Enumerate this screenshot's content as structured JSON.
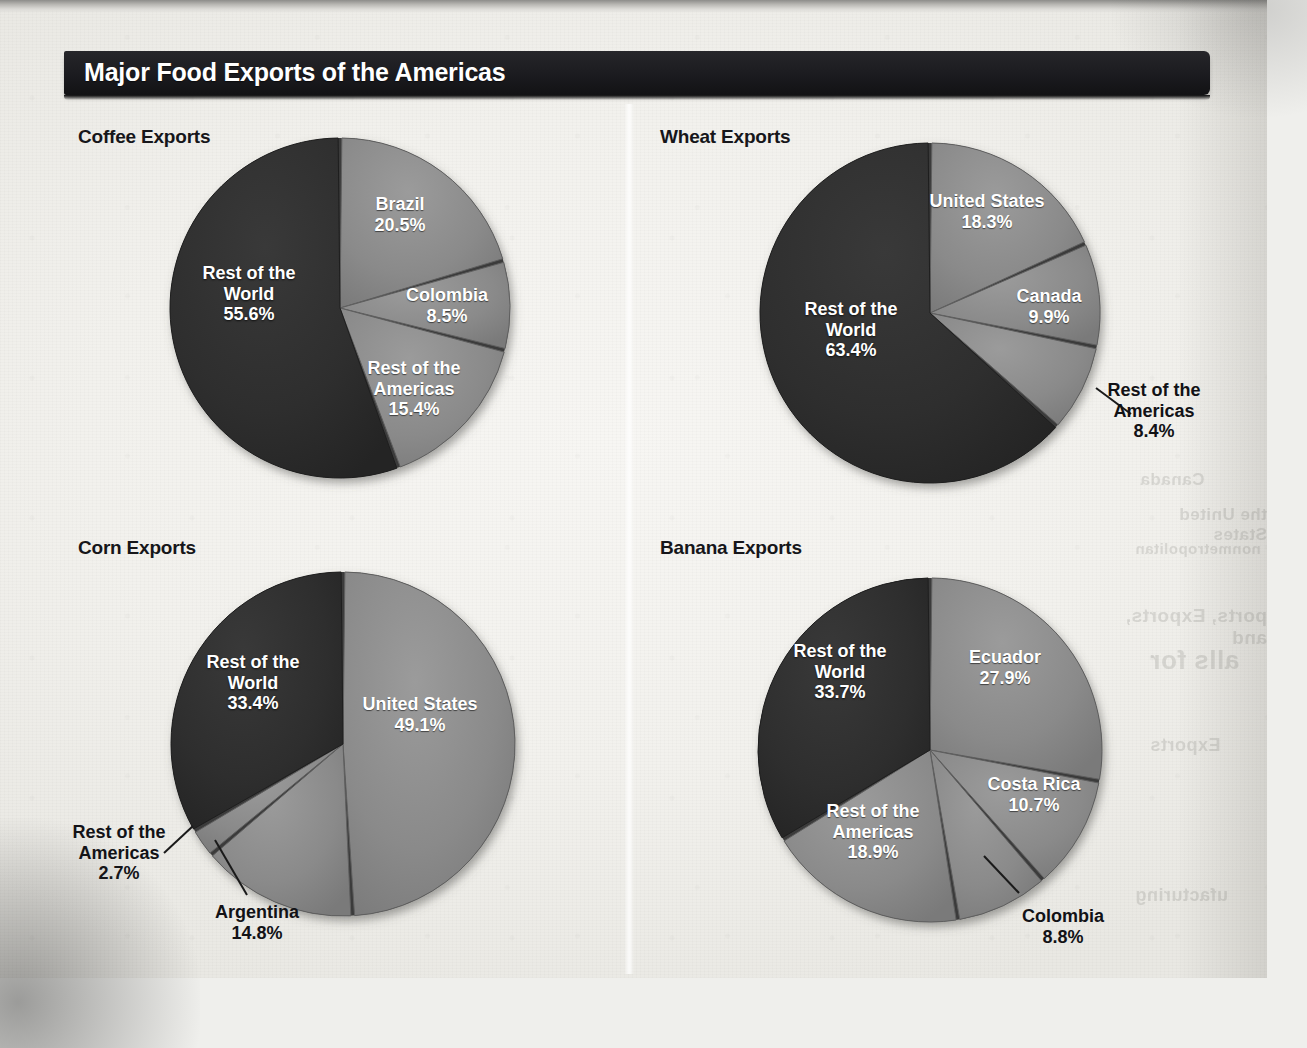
{
  "figure": {
    "title": "Major Food Exports of the Americas",
    "colors": {
      "title_bar": "#1b1b1f",
      "title_text": "#ffffff",
      "slice_dark": "#2e2e2e",
      "slice_light": "#8a8a8a",
      "slice_mid": "#6f6f6f",
      "label_dark": "#121216",
      "paper": "#f2f1ed"
    }
  },
  "ghost_text": [
    {
      "text": "Canada",
      "x": 1140,
      "y": 470,
      "size": 17
    },
    {
      "text": "the United States",
      "x": 1120,
      "y": 505,
      "size": 17
    },
    {
      "text": "nonmetropolitan",
      "x": 1135,
      "y": 540,
      "size": 15
    },
    {
      "text": "ports, Exports, and",
      "x": 1120,
      "y": 605,
      "size": 19
    },
    {
      "text": "alls for",
      "x": 1150,
      "y": 645,
      "size": 26
    },
    {
      "text": "Exports",
      "x": 1150,
      "y": 735,
      "size": 18
    },
    {
      "text": "ufacturing",
      "x": 1135,
      "y": 885,
      "size": 18
    }
  ],
  "chart_data": [
    {
      "id": "coffee",
      "type": "pie",
      "title": "Coffee Exports",
      "unit": "%",
      "start_angle_deg": 0,
      "direction": "clockwise",
      "categories": [
        "Brazil",
        "Colombia",
        "Rest of the Americas",
        "Rest of the World"
      ],
      "values": [
        20.5,
        8.5,
        15.4,
        55.6
      ],
      "slices": [
        {
          "label": "Brazil",
          "value": 20.5,
          "value_text": "20.5%",
          "shade": "light",
          "label_placement": "inside",
          "label_x": 400,
          "label_y": 215
        },
        {
          "label": "Colombia",
          "value": 8.5,
          "value_text": "8.5%",
          "shade": "light",
          "label_placement": "inside",
          "label_x": 447,
          "label_y": 306
        },
        {
          "label": "Rest of the Americas",
          "value": 15.4,
          "value_text": "15.4%",
          "shade": "light",
          "label_placement": "inside",
          "label_x": 414,
          "label_y": 389
        },
        {
          "label": "Rest of the World",
          "value": 55.6,
          "value_text": "55.6%",
          "shade": "dark",
          "label_placement": "inside",
          "label_x": 249,
          "label_y": 294
        }
      ]
    },
    {
      "id": "wheat",
      "type": "pie",
      "title": "Wheat Exports",
      "unit": "%",
      "start_angle_deg": 0,
      "direction": "clockwise",
      "categories": [
        "United States",
        "Canada",
        "Rest of the Americas",
        "Rest of the World"
      ],
      "values": [
        18.3,
        9.9,
        8.4,
        63.4
      ],
      "slices": [
        {
          "label": "United States",
          "value": 18.3,
          "value_text": "18.3%",
          "shade": "light",
          "label_placement": "inside",
          "label_x": 987,
          "label_y": 212
        },
        {
          "label": "Canada",
          "value": 9.9,
          "value_text": "9.9%",
          "shade": "light",
          "label_placement": "inside",
          "label_x": 1049,
          "label_y": 307
        },
        {
          "label": "Rest of the Americas",
          "value": 8.4,
          "value_text": "8.4%",
          "shade": "light",
          "label_placement": "outside",
          "label_x": 1154,
          "label_y": 411,
          "leader": [
            1096,
            388,
            1131,
            414
          ]
        },
        {
          "label": "Rest of the World",
          "value": 63.4,
          "value_text": "63.4%",
          "shade": "dark",
          "label_placement": "inside",
          "label_x": 851,
          "label_y": 330
        }
      ]
    },
    {
      "id": "corn",
      "type": "pie",
      "title": "Corn Exports",
      "unit": "%",
      "start_angle_deg": 0,
      "direction": "clockwise",
      "categories": [
        "United States",
        "Argentina",
        "Rest of the Americas",
        "Rest of the World"
      ],
      "values": [
        49.1,
        14.8,
        2.7,
        33.4
      ],
      "slices": [
        {
          "label": "United States",
          "value": 49.1,
          "value_text": "49.1%",
          "shade": "light",
          "label_placement": "inside",
          "label_x": 420,
          "label_y": 715
        },
        {
          "label": "Argentina",
          "value": 14.8,
          "value_text": "14.8%",
          "shade": "light",
          "label_placement": "outside",
          "label_x": 257,
          "label_y": 923,
          "leader": [
            215,
            840,
            247,
            895
          ]
        },
        {
          "label": "Rest of the Americas",
          "value": 2.7,
          "value_text": "2.7%",
          "shade": "light",
          "label_placement": "outside",
          "label_x": 119,
          "label_y": 853,
          "leader": [
            193,
            826,
            164,
            853
          ]
        },
        {
          "label": "Rest of the World",
          "value": 33.4,
          "value_text": "33.4%",
          "shade": "dark",
          "label_placement": "inside",
          "label_x": 253,
          "label_y": 683
        }
      ]
    },
    {
      "id": "banana",
      "type": "pie",
      "title": "Banana Exports",
      "unit": "%",
      "start_angle_deg": 0,
      "direction": "clockwise",
      "categories": [
        "Ecuador",
        "Costa Rica",
        "Colombia",
        "Rest of the Americas",
        "Rest of the World"
      ],
      "values": [
        27.9,
        10.7,
        8.8,
        18.9,
        33.7
      ],
      "slices": [
        {
          "label": "Ecuador",
          "value": 27.9,
          "value_text": "27.9%",
          "shade": "light",
          "label_placement": "inside",
          "label_x": 1005,
          "label_y": 668
        },
        {
          "label": "Costa Rica",
          "value": 10.7,
          "value_text": "10.7%",
          "shade": "light",
          "label_placement": "inside",
          "label_x": 1034,
          "label_y": 795
        },
        {
          "label": "Colombia",
          "value": 8.8,
          "value_text": "8.8%",
          "shade": "light",
          "label_placement": "outside",
          "label_x": 1063,
          "label_y": 927,
          "leader": [
            984,
            856,
            1019,
            893
          ]
        },
        {
          "label": "Rest of the Americas",
          "value": 18.9,
          "value_text": "18.9%",
          "shade": "light",
          "label_placement": "inside",
          "label_x": 873,
          "label_y": 832
        },
        {
          "label": "Rest of the World",
          "value": 33.7,
          "value_text": "33.7%",
          "shade": "dark",
          "label_placement": "inside",
          "label_x": 840,
          "label_y": 672
        }
      ]
    }
  ],
  "panels": [
    {
      "id": "coffee",
      "title_x": 78,
      "title_y": 126,
      "cx": 340,
      "cy": 308,
      "r": 170
    },
    {
      "id": "wheat",
      "title_x": 660,
      "title_y": 126,
      "cx": 930,
      "cy": 313,
      "r": 170
    },
    {
      "id": "corn",
      "title_x": 78,
      "title_y": 537,
      "cx": 343,
      "cy": 744,
      "r": 172
    },
    {
      "id": "banana",
      "title_x": 660,
      "title_y": 537,
      "cx": 930,
      "cy": 750,
      "r": 172
    }
  ]
}
